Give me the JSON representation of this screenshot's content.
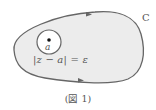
{
  "figure": {
    "curve_label": "C",
    "point_label": "a",
    "circle_equation": "|z − a| = ε",
    "caption": "(図 1)",
    "colors": {
      "fill": "#ececec",
      "stroke": "#666666",
      "text": "#555555",
      "point": "#111111"
    }
  }
}
